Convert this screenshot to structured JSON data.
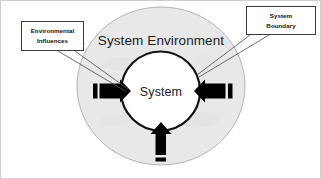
{
  "diagram": {
    "type": "system-environment-boundary-diagram",
    "outer_region_label": "System Environment",
    "inner_region_label": "System",
    "colors": {
      "environment_fill": "#e8e8e8",
      "environment_stroke": "#b4b4b4",
      "system_fill": "#ffffff",
      "system_stroke": "#000000",
      "arrow_fill": "#000000",
      "callout_border": "#3d3d3d",
      "text": "#1b1b1b",
      "page_background": "#ffffff"
    }
  },
  "callouts": {
    "environmental_influences": {
      "line1": "Environmental",
      "line2": "Influences"
    },
    "system_boundary": {
      "line1": "System",
      "line2": "Boundary"
    }
  },
  "arrows": {
    "left": {
      "name": "input-arrow-left",
      "direction": "right"
    },
    "right": {
      "name": "input-arrow-right",
      "direction": "left"
    },
    "bottom": {
      "name": "input-arrow-bottom",
      "direction": "up"
    }
  }
}
